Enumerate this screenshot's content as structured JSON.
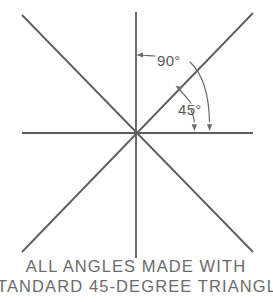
{
  "figure": {
    "title": "Angles made with standard 45-degree triangle",
    "background_color": "#ffffff",
    "line_color": "#5c5c5c",
    "text_color": "#6b6b6b",
    "leader_color": "#6a6a6a"
  },
  "annotations": {
    "angle_90": {
      "label": "90°",
      "value": 90,
      "unit": "degrees",
      "measures": "vertical-axis to horizontal-axis"
    },
    "angle_45": {
      "label": "45°",
      "value": 45,
      "unit": "degrees",
      "measures": "diagonal-line to horizontal-axis"
    }
  },
  "caption": {
    "line1": "ALL  ANGLES  MADE  WITH",
    "line2": "STANDARD  45-DEGREE  TRIANGLE"
  },
  "geometry": {
    "center_x": 136,
    "center_y": 133,
    "lines": [
      {
        "name": "horizontal-axis",
        "x1": 22,
        "y1": 133,
        "x2": 253,
        "y2": 133,
        "angle_deg": 0
      },
      {
        "name": "vertical-axis",
        "x1": 136,
        "y1": 12,
        "x2": 136,
        "y2": 258,
        "angle_deg": 90
      },
      {
        "name": "diagonal-up-right",
        "x1": 22,
        "y1": 252,
        "x2": 253,
        "y2": 13,
        "angle_deg": 45
      },
      {
        "name": "diagonal-up-left",
        "x1": 22,
        "y1": 15,
        "x2": 253,
        "y2": 252,
        "angle_deg": 135
      }
    ]
  }
}
